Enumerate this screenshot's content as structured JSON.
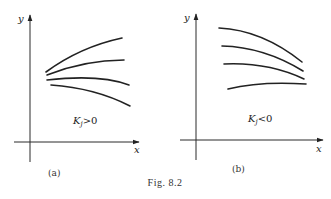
{
  "figure": {
    "caption": "Fig. 8.2",
    "panels": [
      {
        "id": "a",
        "label": "(a)",
        "annotation_main": "K",
        "annotation_sub": "j",
        "annotation_rel": ">0",
        "x_axis_label": "x",
        "y_axis_label": "y"
      },
      {
        "id": "b",
        "label": "(b)",
        "annotation_main": "K",
        "annotation_sub": "j",
        "annotation_rel": "<0",
        "x_axis_label": "x",
        "y_axis_label": "y"
      }
    ]
  }
}
